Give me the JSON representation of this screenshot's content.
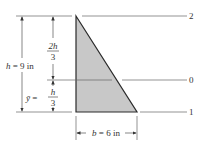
{
  "diagram": {
    "type": "triangle-centroid-dimension",
    "colors": {
      "fill": "#c8c8c8",
      "stroke": "#2a2a2a",
      "line": "#555555",
      "text": "#333333"
    },
    "reference_lines": [
      {
        "id": "2",
        "label": "2",
        "position": "top"
      },
      {
        "id": "0",
        "label": "0",
        "position": "centroid"
      },
      {
        "id": "1",
        "label": "1",
        "position": "base"
      }
    ],
    "dimensions": {
      "height": {
        "symbol": "h",
        "eq": "=",
        "value": "9 in"
      },
      "upper": {
        "numerator": "2h",
        "denominator": "3"
      },
      "lower": {
        "symbol": "ȳ",
        "eq": "=",
        "numerator": "h",
        "denominator": "3"
      },
      "base": {
        "symbol": "b",
        "eq": "=",
        "value": "6 in"
      }
    }
  }
}
